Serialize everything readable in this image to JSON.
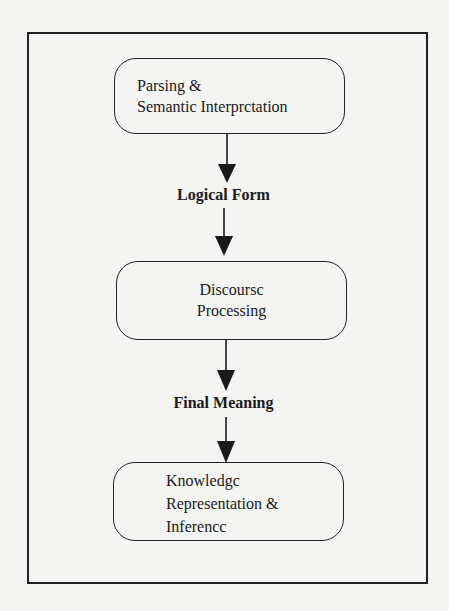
{
  "diagram": {
    "stages": [
      {
        "id": "parsing",
        "lines": [
          "Parsing &",
          "Semantic Interprctation"
        ]
      },
      {
        "id": "discourse",
        "lines": [
          "Discoursc",
          "Processing"
        ]
      },
      {
        "id": "knowledge",
        "lines": [
          "Knowledgc",
          "Representation &",
          "Inferencc"
        ]
      }
    ],
    "intermediate_labels": [
      {
        "text": "Logical Form"
      },
      {
        "text": "Final Meaning"
      }
    ],
    "flow": [
      "Parsing & Semantic Interpretation",
      "Logical Form",
      "Discourse Processing",
      "Final Meaning",
      "Knowledge Representation & Inference"
    ],
    "colors": {
      "background": "#f4f4f2",
      "ink": "#1a1a1a"
    }
  }
}
